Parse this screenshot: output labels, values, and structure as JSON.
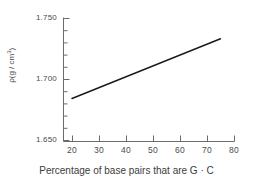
{
  "chart_data": {
    "type": "line",
    "title": "",
    "subtitle": "",
    "xlabel": "Percentage of base pairs that are G · C",
    "ylabel": "ρ (g / cm³)",
    "ylabel_symbol": "ρ",
    "ylabel_units_prefix": "(g / cm",
    "ylabel_units_sup": "3",
    "ylabel_units_suffix": ")",
    "xlim": [
      15,
      80
    ],
    "ylim": [
      1.65,
      1.75
    ],
    "grid": false,
    "legend": null,
    "x_ticks": [
      20,
      30,
      40,
      50,
      60,
      70,
      80
    ],
    "x_tick_labels": [
      "20",
      "30",
      "40",
      "50",
      "60",
      "70",
      "80"
    ],
    "x_minor_ticks": [],
    "y_ticks": [
      1.65,
      1.7,
      1.75
    ],
    "y_tick_labels": [
      "1.650",
      "1.700",
      "1.750"
    ],
    "y_minor_ticks": [
      1.66,
      1.67,
      1.68,
      1.69,
      1.71,
      1.72,
      1.73,
      1.74
    ],
    "series": [
      {
        "name": "density vs G+C content",
        "x": [
          20,
          75
        ],
        "y": [
          1.684,
          1.733
        ],
        "color": "#1a1a1a",
        "line_width": 1.4,
        "markers": false
      }
    ]
  },
  "axis_color": "#6b6b6b",
  "text_color": "#4a4a4a",
  "background_color": "#ffffff"
}
